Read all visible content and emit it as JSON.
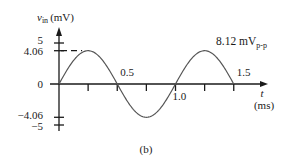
{
  "figure": {
    "caption": "(b)",
    "y_axis": {
      "symbol": "v",
      "subscript": "in",
      "unit": "(mV)"
    },
    "x_axis": {
      "symbol": "t",
      "unit": "(ms)"
    },
    "y_ticks": [
      {
        "value": 5,
        "label": "5"
      },
      {
        "value": 4.06,
        "label": "4.06"
      },
      {
        "value": 0,
        "label": "0"
      },
      {
        "value": -4.06,
        "label": "−4.06"
      },
      {
        "value": -5,
        "label": "−5"
      }
    ],
    "x_ticks": [
      {
        "value": 0.25,
        "label": ""
      },
      {
        "value": 0.5,
        "label": "0.5"
      },
      {
        "value": 0.75,
        "label": ""
      },
      {
        "value": 1.0,
        "label": "1.0"
      },
      {
        "value": 1.25,
        "label": ""
      },
      {
        "value": 1.5,
        "label": "1.5"
      }
    ],
    "annotation": {
      "main": "8.12 mV",
      "subscript": "p-p"
    },
    "colors": {
      "line": "#1a1a1a",
      "curve": "#555555",
      "background": "#ffffff"
    }
  },
  "chart_data": {
    "type": "line",
    "title": "",
    "xlabel": "t (ms)",
    "ylabel": "v_in (mV)",
    "xlim": [
      0,
      1.5
    ],
    "ylim": [
      -5,
      5
    ],
    "grid": false,
    "legend": "none",
    "series": [
      {
        "name": "v_in",
        "function": "4.06*sin(2*pi*t/1.0)",
        "amplitude_mV": 4.06,
        "period_ms": 1.0,
        "peak_to_peak_mV": 8.12,
        "x": [
          0,
          0.125,
          0.25,
          0.375,
          0.5,
          0.625,
          0.75,
          0.875,
          1.0,
          1.125,
          1.25,
          1.375,
          1.5
        ],
        "values": [
          0,
          2.87,
          4.06,
          2.87,
          0,
          -2.87,
          -4.06,
          -2.87,
          0,
          2.87,
          4.06,
          2.87,
          0
        ]
      }
    ],
    "annotations": [
      {
        "text": "8.12 mV_p-p",
        "meaning": "peak-to-peak amplitude"
      },
      {
        "text": "dashed line at 4.06 mV",
        "meaning": "peak marker"
      }
    ],
    "x_tick_labels": [
      "0.5",
      "1.0",
      "1.5"
    ],
    "y_tick_labels": [
      "5",
      "4.06",
      "0",
      "-4.06",
      "-5"
    ]
  }
}
